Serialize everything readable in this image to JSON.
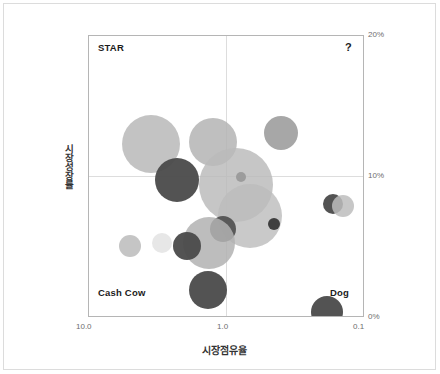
{
  "chart_data": {
    "type": "scatter",
    "title": "",
    "xlabel": "시장점유율",
    "ylabel": "시장성장률",
    "xticks": [
      "10.0",
      "1.0",
      "0.1"
    ],
    "yticks": [
      "20%",
      "10%",
      "0%"
    ],
    "xlim": [
      10.0,
      0.1
    ],
    "ylim": [
      0,
      20
    ],
    "x_scale": "log-reversed",
    "grid": true,
    "legend": "none",
    "quadrant_labels": {
      "top_left": "STAR",
      "top_right": "?",
      "bottom_left": "Cash Cow",
      "bottom_right": "Dog"
    },
    "colors": {
      "bubble_light": "#c9c9c9",
      "bubble_mid": "#a8a8a8",
      "bubble_dark": "#4a4a4a",
      "bubble_pale": "#e4e4e4",
      "frame": "#b5b5b5",
      "grid": "#dddddd",
      "text": "#1b1b1b"
    },
    "points": [
      {
        "id": "b1",
        "cx": 146,
        "cy": 139,
        "r": 29,
        "fill": "#bdbdbd",
        "opacity": 0.9
      },
      {
        "id": "b2",
        "cx": 208,
        "cy": 137,
        "r": 24,
        "fill": "#b4b4b4",
        "opacity": 0.85
      },
      {
        "id": "b3",
        "cx": 276,
        "cy": 128,
        "r": 17,
        "fill": "#a2a2a2",
        "opacity": 0.95
      },
      {
        "id": "b4",
        "cx": 172,
        "cy": 175,
        "r": 22,
        "fill": "#4a4a4a",
        "opacity": 0.95
      },
      {
        "id": "b5",
        "cx": 231,
        "cy": 180,
        "r": 37,
        "fill": "#b9b9b9",
        "opacity": 0.82
      },
      {
        "id": "b6",
        "cx": 245,
        "cy": 211,
        "r": 32,
        "fill": "#bcbcbc",
        "opacity": 0.8
      },
      {
        "id": "b7",
        "cx": 236,
        "cy": 172,
        "r": 5,
        "fill": "#9a9a9a",
        "opacity": 0.95
      },
      {
        "id": "b8",
        "cx": 218,
        "cy": 224,
        "r": 13,
        "fill": "#4f4f4f",
        "opacity": 0.92
      },
      {
        "id": "b9",
        "cx": 269,
        "cy": 219,
        "r": 6,
        "fill": "#3f3f3f",
        "opacity": 1.0
      },
      {
        "id": "b10",
        "cx": 204,
        "cy": 238,
        "r": 26,
        "fill": "#b2b2b2",
        "opacity": 0.85
      },
      {
        "id": "b11",
        "cx": 182,
        "cy": 241,
        "r": 14,
        "fill": "#4a4a4a",
        "opacity": 0.95
      },
      {
        "id": "b12",
        "cx": 157,
        "cy": 238,
        "r": 10,
        "fill": "#e6e6e6",
        "opacity": 0.95
      },
      {
        "id": "b13",
        "cx": 125,
        "cy": 241,
        "r": 11,
        "fill": "#c2c2c2",
        "opacity": 0.95
      },
      {
        "id": "b14",
        "cx": 203,
        "cy": 285,
        "r": 19,
        "fill": "#4a4a4a",
        "opacity": 0.95
      },
      {
        "id": "b15",
        "cx": 328,
        "cy": 199,
        "r": 10,
        "fill": "#4a4a4a",
        "opacity": 0.95
      },
      {
        "id": "b16",
        "cx": 338,
        "cy": 201,
        "r": 11,
        "fill": "#bdbdbd",
        "opacity": 0.85
      },
      {
        "id": "b17",
        "cx": 322,
        "cy": 307,
        "r": 16,
        "fill": "#4a4a4a",
        "opacity": 0.95
      }
    ]
  }
}
